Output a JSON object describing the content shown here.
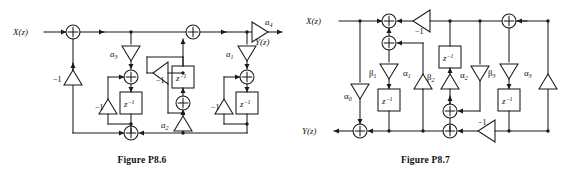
{
  "page": {
    "background": "#ffffff",
    "line_color": "#1a1a1a",
    "figure_count": 2
  },
  "figures": [
    {
      "id": "figure-p86",
      "caption": "Figure P8.6",
      "input_label": "X(z)",
      "output_label": "Y(z)",
      "delay_label": "z",
      "delay_exponent": "-1",
      "adders": 6,
      "delays": 3,
      "gains": [
        {
          "name": "a4",
          "base": "a",
          "sub": "4",
          "direction": "right"
        },
        {
          "name": "a3",
          "base": "a",
          "sub": "3",
          "direction": "down"
        },
        {
          "name": "a1",
          "base": "a",
          "sub": "1",
          "direction": "down"
        },
        {
          "name": "a2",
          "base": "a",
          "sub": "2",
          "direction": "up"
        },
        {
          "name": "neg1-left",
          "base": "-1",
          "sub": "",
          "direction": "up"
        },
        {
          "name": "neg1-mid-left",
          "base": "-1",
          "sub": "",
          "direction": "up"
        },
        {
          "name": "neg1-center",
          "base": "-1",
          "sub": "",
          "direction": "left"
        },
        {
          "name": "neg1-right",
          "base": "-1",
          "sub": "",
          "direction": "up"
        }
      ],
      "negative_one_label": "−1"
    },
    {
      "id": "figure-p87",
      "caption": "Figure P8.7",
      "input_label": "X(z)",
      "output_label": "Y(z)",
      "delay_label": "z",
      "delay_exponent": "-1",
      "adders": 6,
      "delays": 3,
      "gains": [
        {
          "name": "alpha0",
          "base": "α",
          "sub": "0",
          "direction": "down"
        },
        {
          "name": "beta1",
          "base": "β",
          "sub": "1",
          "direction": "down"
        },
        {
          "name": "alpha1",
          "base": "α",
          "sub": "1",
          "direction": "up"
        },
        {
          "name": "beta2",
          "base": "β",
          "sub": "2",
          "direction": "up"
        },
        {
          "name": "alpha2",
          "base": "α",
          "sub": "2",
          "direction": "down"
        },
        {
          "name": "beta3",
          "base": "β",
          "sub": "3",
          "direction": "down"
        },
        {
          "name": "alpha3",
          "base": "α",
          "sub": "3",
          "direction": "up"
        },
        {
          "name": "neg1-top",
          "base": "-1",
          "sub": "",
          "direction": "left"
        },
        {
          "name": "neg1-bottom",
          "base": "-1",
          "sub": "",
          "direction": "left"
        }
      ],
      "negative_one_label": "−1"
    }
  ],
  "labels": {
    "x_of_z": "X(z)",
    "y_of_z": "Y(z)",
    "z_inv_base": "z",
    "z_inv_exp": "−1",
    "minus_one": "−1",
    "a1": "a",
    "a1_sub": "1",
    "a2": "a",
    "a2_sub": "2",
    "a3": "a",
    "a3_sub": "3",
    "a4": "a",
    "a4_sub": "4",
    "alpha": "α",
    "beta": "β",
    "sub0": "0",
    "sub1": "1",
    "sub2": "2",
    "sub3": "3",
    "caption_left": "Figure P8.6",
    "caption_right": "Figure P8.7"
  }
}
